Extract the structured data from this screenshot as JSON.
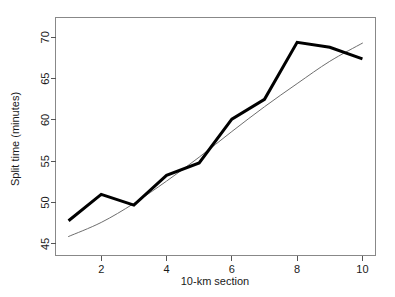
{
  "chart_data": {
    "type": "line",
    "title": "",
    "xlabel": "10-km section",
    "ylabel": "Split time (minutes)",
    "xlim": [
      0.6,
      10.4
    ],
    "ylim": [
      43.6,
      72.4
    ],
    "xticks": [
      2,
      4,
      6,
      8,
      10
    ],
    "yticks": [
      45,
      50,
      55,
      60,
      65,
      70
    ],
    "grid": false,
    "legend": "none",
    "x": [
      1,
      2,
      3,
      4,
      5,
      6,
      7,
      8,
      9,
      10
    ],
    "series": [
      {
        "name": "Observed split time",
        "style": "thick-black-line",
        "color": "#000000",
        "values": [
          47.8,
          51.0,
          49.7,
          53.3,
          54.8,
          60.1,
          62.5,
          69.4,
          68.8,
          67.4
        ]
      },
      {
        "name": "Fitted smooth trend",
        "style": "thin-grey-curve",
        "color": "#6e6e6e",
        "values": [
          45.9,
          47.6,
          49.9,
          52.6,
          55.5,
          58.6,
          61.6,
          64.4,
          67.1,
          69.3
        ]
      }
    ]
  },
  "axes": {
    "x_title": "10-km section",
    "y_title": "Split time (minutes)",
    "x_tick_labels": [
      "2",
      "4",
      "6",
      "8",
      "10"
    ],
    "y_tick_labels": [
      "45",
      "50",
      "55",
      "60",
      "65",
      "70"
    ]
  }
}
